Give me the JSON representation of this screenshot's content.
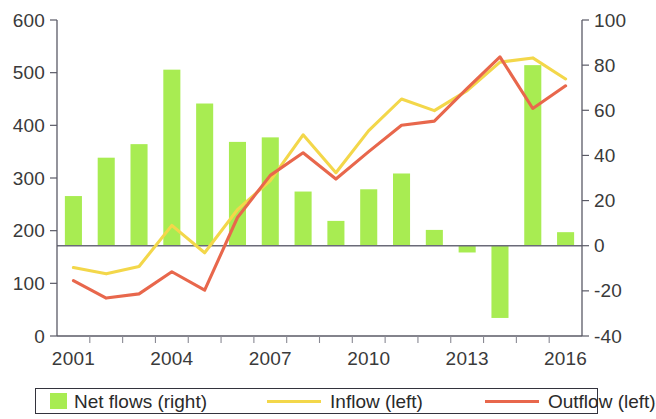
{
  "chart_data": {
    "type": "bar",
    "title": "",
    "subtitle": "",
    "xlabel": "",
    "ylabel": "",
    "x": [
      2001,
      2002,
      2003,
      2004,
      2005,
      2006,
      2007,
      2008,
      2009,
      2010,
      2011,
      2012,
      2013,
      2014,
      2015,
      2016
    ],
    "categories": [
      "2001",
      "2002",
      "2003",
      "2004",
      "2005",
      "2006",
      "2007",
      "2008",
      "2009",
      "2010",
      "2011",
      "2012",
      "2013",
      "2014",
      "2015",
      "2016"
    ],
    "x_tick_labels": [
      "2001",
      "2004",
      "2007",
      "2010",
      "2013",
      "2016"
    ],
    "x_tick_values": [
      2001,
      2004,
      2007,
      2010,
      2013,
      2016
    ],
    "left_axis": {
      "label": "",
      "ylim": [
        0,
        600
      ],
      "ticks": [
        0,
        100,
        200,
        300,
        400,
        500,
        600
      ],
      "tick_labels": [
        "0",
        "100",
        "200",
        "300",
        "400",
        "500",
        "600"
      ]
    },
    "right_axis": {
      "label": "",
      "ylim": [
        -40,
        100
      ],
      "ticks": [
        -40,
        -20,
        0,
        20,
        40,
        60,
        80,
        100
      ],
      "tick_labels": [
        "-40",
        "-20",
        "0",
        "20",
        "40",
        "60",
        "80",
        "100"
      ]
    },
    "grid": false,
    "legend_position": "bottom",
    "series": [
      {
        "name": "Net flows (right)",
        "type": "bar",
        "axis": "right",
        "color": "#a8ec52",
        "values": [
          22,
          39,
          45,
          78,
          63,
          46,
          48,
          24,
          11,
          25,
          32,
          7,
          -3,
          -32,
          80,
          6
        ]
      },
      {
        "name": "Inflow (left)",
        "type": "line",
        "axis": "left",
        "color": "#f3d74a",
        "values": [
          130,
          118,
          132,
          210,
          158,
          240,
          295,
          382,
          310,
          390,
          450,
          428,
          466,
          520,
          528,
          488
        ]
      },
      {
        "name": "Outflow (left)",
        "type": "line",
        "axis": "left",
        "color": "#e8674c",
        "values": [
          105,
          72,
          80,
          122,
          87,
          225,
          305,
          348,
          298,
          350,
          400,
          408,
          470,
          530,
          432,
          475
        ]
      }
    ]
  },
  "legend": {
    "items": [
      {
        "label": "Net flows (right)",
        "marker": "box",
        "color": "#a8ec52"
      },
      {
        "label": "Inflow (left)",
        "marker": "line",
        "color": "#f3d74a"
      },
      {
        "label": "Outflow (left)",
        "marker": "line",
        "color": "#e8674c"
      }
    ]
  }
}
